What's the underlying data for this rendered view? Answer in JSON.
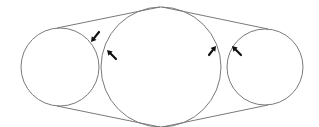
{
  "diagram": {
    "stroke_color": "#7a7a7a",
    "arrow_color": "#111111",
    "background": "#ffffff",
    "circles": [
      {
        "id": "left",
        "cx": 60,
        "cy": 67,
        "r": 39
      },
      {
        "id": "middle",
        "cx": 161,
        "cy": 67,
        "r": 60
      },
      {
        "id": "right",
        "cx": 265,
        "cy": 67,
        "r": 38
      }
    ],
    "tangents": [
      {
        "x1": 57,
        "y1": 28,
        "x2": 160,
        "y2": 7
      },
      {
        "x1": 57,
        "y1": 106,
        "x2": 160,
        "y2": 127
      },
      {
        "x1": 162,
        "y1": 7,
        "x2": 268,
        "y2": 29
      },
      {
        "x1": 162,
        "y1": 127,
        "x2": 268,
        "y2": 105
      }
    ],
    "arrows": [
      {
        "id": "arrow-left-circle",
        "tipX": 91,
        "tipY": 42,
        "tailX": 99,
        "tailY": 32
      },
      {
        "id": "arrow-middle-left",
        "tipX": 107,
        "tipY": 50,
        "tailX": 116,
        "tailY": 59
      },
      {
        "id": "arrow-middle-right",
        "tipX": 216,
        "tipY": 46,
        "tailX": 209,
        "tailY": 55
      },
      {
        "id": "arrow-right-circle",
        "tipX": 232,
        "tipY": 46,
        "tailX": 241,
        "tailY": 55
      }
    ]
  }
}
